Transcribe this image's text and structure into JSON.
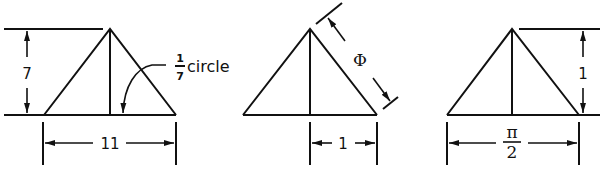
{
  "figures": [
    {
      "id": "triangle-1",
      "height_label": "7",
      "width_label": "11",
      "angle_note": {
        "numerator": "1",
        "denominator": "7",
        "text": "circle"
      }
    },
    {
      "id": "triangle-2",
      "slant_label": "Φ",
      "half_width_label": "1"
    },
    {
      "id": "triangle-3",
      "height_label": "1",
      "width_label_numerator": "π",
      "width_label_denominator": "2"
    }
  ],
  "colors": {
    "line": "#111111",
    "background": "#ffffff"
  }
}
